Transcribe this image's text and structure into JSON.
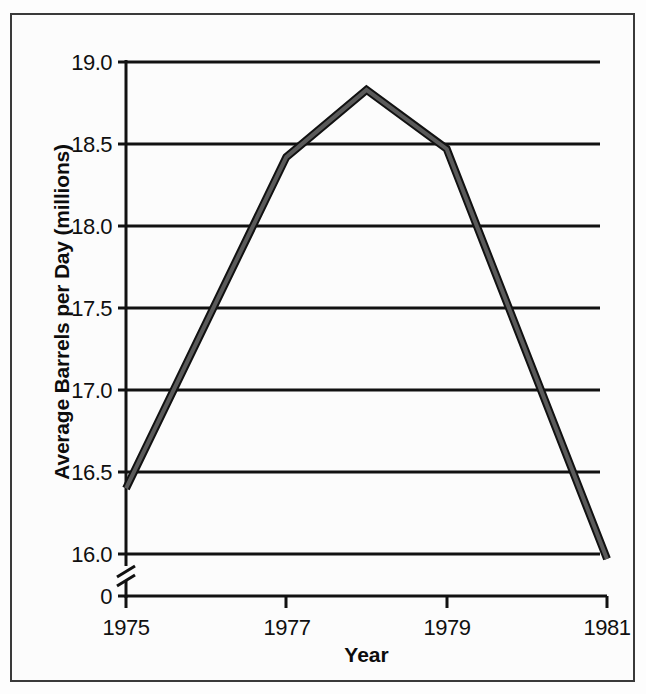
{
  "chart_data": {
    "type": "line",
    "title": "",
    "xlabel": "Year",
    "ylabel": "Average Barrels per Day (millions)",
    "x": [
      1975,
      1977,
      1978,
      1979,
      1981
    ],
    "values": [
      16.4,
      18.42,
      18.83,
      18.47,
      15.97
    ],
    "series": [
      {
        "name": "Average Barrels per Day",
        "values": [
          16.4,
          18.42,
          18.83,
          18.47,
          15.97
        ],
        "color": "#5a5a5a",
        "outline_color": "#111111"
      }
    ],
    "xlim": [
      1975,
      1981
    ],
    "ylim": [
      15.75,
      19.0
    ],
    "xticks": [
      1975,
      1977,
      1979,
      1981
    ],
    "xtick_labels": [
      "1975",
      "1977",
      "1979",
      "1981"
    ],
    "yticks": [
      16.0,
      16.5,
      17.0,
      17.5,
      18.0,
      18.5,
      19.0
    ],
    "ytick_labels": [
      "16.0",
      "16.5",
      "17.0",
      "17.5",
      "18.0",
      "18.5",
      "19.0"
    ],
    "baseline_tick_label": "0",
    "axis_break": true,
    "axis_break_symbol": "double-slash",
    "grid": true,
    "grid_axis": "y",
    "legend": false,
    "legend_position": "none"
  },
  "axis": {
    "y_tick_labels": [
      "19.0",
      "18.5",
      "18.0",
      "17.5",
      "17.0",
      "16.5",
      "16.0",
      "0"
    ],
    "x_tick_labels": [
      "1975",
      "1977",
      "1979",
      "1981"
    ],
    "y_title": "Average Barrels per Day (millions)",
    "x_title": "Year"
  },
  "style": {
    "frame_color": "#3a3a3a",
    "grid_color": "#111111",
    "axis_color": "#111111",
    "line_color": "#5a5a5a",
    "line_outline_color": "#111111",
    "background": "#fcfcfc",
    "text_color": "#101010"
  }
}
